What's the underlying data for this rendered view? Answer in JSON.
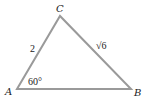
{
  "figure": {
    "type": "triangle",
    "edge_color": "#9a9a9a",
    "vertices": {
      "A": {
        "label": "A",
        "x": 17,
        "y": 89
      },
      "B": {
        "label": "B",
        "x": 131,
        "y": 89
      },
      "C": {
        "label": "C",
        "x": 60,
        "y": 16
      }
    },
    "sides": {
      "AC": {
        "label": "2"
      },
      "CB": {
        "label": "√6"
      }
    },
    "angles": {
      "A": {
        "label": "60°"
      }
    }
  }
}
